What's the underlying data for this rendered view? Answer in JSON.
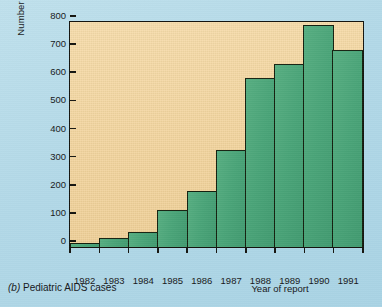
{
  "caption": {
    "tag": "(b)",
    "text": "Pediatric AIDS cases"
  },
  "colors": {
    "background": "#b7dbe9",
    "plot_area": "#f3d49d",
    "bar_fill": "#4aa478",
    "bar_outline": "#14200f",
    "axis": "#14140f",
    "text": "#17181a"
  },
  "chart_data": {
    "type": "bar",
    "title": "",
    "subtitle": "",
    "xlabel": "Year of report",
    "ylabel": "Number of cases",
    "categories": [
      "1982",
      "1983",
      "1984",
      "1985",
      "1986",
      "1987",
      "1988",
      "1989",
      "1990",
      "1991"
    ],
    "values": [
      15,
      32,
      52,
      130,
      198,
      345,
      602,
      652,
      788,
      700
    ],
    "ylim": [
      0,
      800
    ],
    "yticks": [
      0,
      100,
      200,
      300,
      400,
      500,
      600,
      700,
      800
    ],
    "ytick_labels": [
      "0",
      "100",
      "200",
      "300",
      "400",
      "500",
      "600",
      "700",
      "800"
    ],
    "grid": false,
    "legend": null,
    "legend_position": "none",
    "annotations": []
  }
}
